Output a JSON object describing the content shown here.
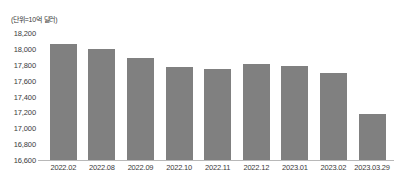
{
  "chart_data": {
    "type": "bar",
    "title": "",
    "subtitle": "",
    "unit_note": "(단위=10억 달러)",
    "xlabel": "",
    "ylabel": "",
    "ylim": [
      16600,
      18200
    ],
    "ytick_step": 200,
    "ytick_labels": [
      "18,200",
      "18,000",
      "17,800",
      "17,600",
      "17,400",
      "17,200",
      "17,000",
      "16,800",
      "16,600"
    ],
    "ytick_values": [
      18200,
      18000,
      17800,
      17600,
      17400,
      17200,
      17000,
      16800,
      16600
    ],
    "grid": false,
    "legend": false,
    "bar_color": "#808080",
    "categories": [
      "2022.02",
      "2022.08",
      "2022.09",
      "2022.10",
      "2022.11",
      "2022.12",
      "2023.01",
      "2023.02",
      "2023.03.29"
    ],
    "values": [
      18060,
      18000,
      17880,
      17770,
      17750,
      17810,
      17780,
      17700,
      17180
    ]
  }
}
